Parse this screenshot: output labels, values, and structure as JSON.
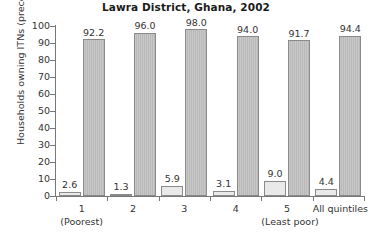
{
  "chart_data": {
    "type": "bar",
    "title": "Lawra District, Ghana, 2002",
    "xlabel": "",
    "ylabel": "Households owning ITNs (precent)",
    "ylim": [
      0,
      100
    ],
    "yticks": [
      0,
      10,
      20,
      30,
      40,
      50,
      60,
      70,
      80,
      90,
      100
    ],
    "ytick_labels": [
      "0",
      "10",
      "20",
      "30",
      "40",
      "50",
      "60",
      "70",
      "80",
      "90",
      "100"
    ],
    "grid": false,
    "legend": "none",
    "categories": [
      "1",
      "2",
      "3",
      "4",
      "5",
      "All quintiles"
    ],
    "category_sublabels": [
      "(Poorest)",
      "",
      "",
      "",
      "(Least poor)",
      ""
    ],
    "series": [
      {
        "name": "light",
        "color": "#e9e9e9",
        "values": [
          2.6,
          1.3,
          5.9,
          3.1,
          9.0,
          4.4
        ],
        "labels": [
          "2.6",
          "1.3",
          "5.9",
          "3.1",
          "9.0",
          "4.4"
        ]
      },
      {
        "name": "dark",
        "color": "#b9b9b9",
        "values": [
          92.2,
          96.0,
          98.0,
          94.0,
          91.7,
          94.4
        ],
        "labels": [
          "92.2",
          "96.0",
          "98.0",
          "94.0",
          "91.7",
          "94.4"
        ]
      }
    ]
  }
}
